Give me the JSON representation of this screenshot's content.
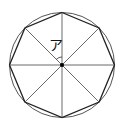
{
  "diagram": {
    "type": "regular-octagon-inscribed-in-circle",
    "angle_label": "ア",
    "center": {
      "x": 62,
      "y": 65
    },
    "radius": 52,
    "sides": 8,
    "colors": {
      "stroke": "#333333",
      "background": "#ffffff"
    }
  }
}
